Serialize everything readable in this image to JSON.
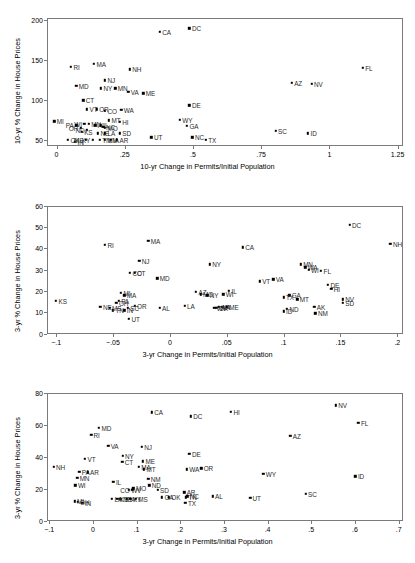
{
  "figure": {
    "panels": [
      "A",
      "B",
      "C"
    ]
  },
  "chart_data": [
    {
      "type": "scatter",
      "title": "Panel A: 1995–2005",
      "xlabel": "10-yr Change in Permits/Initial Population",
      "ylabel": "10-yr % Change in House Prices",
      "xlim": [
        -0.035,
        1.27
      ],
      "ylim": [
        42,
        202
      ],
      "xticks": [
        0,
        0.25,
        0.5,
        0.75,
        1,
        1.25
      ],
      "xticklabels": [
        "0",
        ".25",
        ".5",
        ".75",
        "1",
        "1.25"
      ],
      "yticks": [
        50,
        100,
        150,
        200
      ],
      "yticklabels": [
        "50",
        "100",
        "150",
        "200"
      ],
      "grid": false,
      "legend": false,
      "points": [
        {
          "label": "DC",
          "x": 0.487,
          "y": 189,
          "lp": "r"
        },
        {
          "label": "CA",
          "x": 0.378,
          "y": 185,
          "lp": "r"
        },
        {
          "label": "FL",
          "x": 1.122,
          "y": 140,
          "lp": "r"
        },
        {
          "label": "RI",
          "x": 0.053,
          "y": 141,
          "lp": "r"
        },
        {
          "label": "MA",
          "x": 0.137,
          "y": 145,
          "lp": "r"
        },
        {
          "label": "NH",
          "x": 0.268,
          "y": 138,
          "lp": "r"
        },
        {
          "label": "NJ",
          "x": 0.178,
          "y": 124,
          "lp": "r"
        },
        {
          "label": "AZ",
          "x": 0.862,
          "y": 121,
          "lp": "r"
        },
        {
          "label": "NV",
          "x": 0.935,
          "y": 120,
          "lp": "r"
        },
        {
          "label": "MD",
          "x": 0.072,
          "y": 117,
          "lp": "r"
        },
        {
          "label": "NY",
          "x": 0.163,
          "y": 114,
          "lp": "r"
        },
        {
          "label": "MN",
          "x": 0.215,
          "y": 114,
          "lp": "r"
        },
        {
          "label": "VA",
          "x": 0.263,
          "y": 110,
          "lp": "r"
        },
        {
          "label": "ME",
          "x": 0.318,
          "y": 108,
          "lp": "r"
        },
        {
          "label": "CT",
          "x": 0.098,
          "y": 99,
          "lp": "r"
        },
        {
          "label": "DE",
          "x": 0.487,
          "y": 93,
          "lp": "r"
        },
        {
          "label": "VT",
          "x": 0.112,
          "y": 88,
          "lp": "r"
        },
        {
          "label": "OR",
          "x": 0.147,
          "y": 88,
          "lp": "r"
        },
        {
          "label": "CO",
          "x": 0.178,
          "y": 86,
          "lp": "r"
        },
        {
          "label": "WA",
          "x": 0.237,
          "y": 87,
          "lp": "r"
        },
        {
          "label": "MI",
          "x": -0.008,
          "y": 73,
          "lp": "r"
        },
        {
          "label": "WY",
          "x": 0.452,
          "y": 75,
          "lp": "r"
        },
        {
          "label": "MT",
          "x": 0.192,
          "y": 74,
          "lp": "r"
        },
        {
          "label": "HI",
          "x": 0.232,
          "y": 72,
          "lp": "r"
        },
        {
          "label": "GA",
          "x": 0.478,
          "y": 67,
          "lp": "r"
        },
        {
          "label": "WI",
          "x": 0.102,
          "y": 70,
          "lp": "l"
        },
        {
          "label": "MN2",
          "x": 0.118,
          "y": 70,
          "lp": "r"
        },
        {
          "label": "AL",
          "x": 0.142,
          "y": 68,
          "lp": "r"
        },
        {
          "label": "IL",
          "x": 0.162,
          "y": 68,
          "lp": "r"
        },
        {
          "label": "NC",
          "x": 0.172,
          "y": 66,
          "lp": "r"
        },
        {
          "label": "MO",
          "x": 0.178,
          "y": 65,
          "lp": "r"
        },
        {
          "label": "SC",
          "x": 0.803,
          "y": 61,
          "lp": "r"
        },
        {
          "label": "ID",
          "x": 0.922,
          "y": 58,
          "lp": "r"
        },
        {
          "label": "KS",
          "x": 0.092,
          "y": 60,
          "lp": "r"
        },
        {
          "label": "NE",
          "x": 0.152,
          "y": 58,
          "lp": "r"
        },
        {
          "label": "LA",
          "x": 0.178,
          "y": 58,
          "lp": "r"
        },
        {
          "label": "SD",
          "x": 0.232,
          "y": 58,
          "lp": "r"
        },
        {
          "label": "UT",
          "x": 0.348,
          "y": 53,
          "lp": "r"
        },
        {
          "label": "NC2",
          "x": 0.498,
          "y": 53,
          "lp": "r"
        },
        {
          "label": "TX",
          "x": 0.547,
          "y": 50,
          "lp": "r"
        },
        {
          "label": "OK",
          "x": 0.042,
          "y": 50,
          "lp": "r"
        },
        {
          "label": "IN",
          "x": 0.068,
          "y": 47,
          "lp": "r"
        },
        {
          "label": "MS",
          "x": 0.108,
          "y": 50,
          "lp": "l"
        },
        {
          "label": "KY",
          "x": 0.132,
          "y": 50,
          "lp": "l"
        },
        {
          "label": "TN",
          "x": 0.158,
          "y": 50,
          "lp": "r"
        },
        {
          "label": "NM",
          "x": 0.178,
          "y": 50,
          "lp": "r"
        },
        {
          "label": "IA",
          "x": 0.198,
          "y": 50,
          "lp": "r"
        },
        {
          "label": "AR",
          "x": 0.222,
          "y": 50,
          "lp": "r"
        },
        {
          "label": "ND",
          "x": 0.112,
          "y": 62,
          "lp": "l"
        },
        {
          "label": "OH",
          "x": 0.088,
          "y": 65,
          "lp": "l"
        },
        {
          "label": "PA",
          "x": 0.072,
          "y": 68,
          "lp": "l"
        }
      ]
    },
    {
      "type": "scatter",
      "title": "Panel B: 1999–2002",
      "xlabel": "3-yr Change in Permits/Initial Population",
      "ylabel": "3-yr % Change in House Prices",
      "xlim": [
        -0.108,
        0.205
      ],
      "ylim": [
        0,
        60
      ],
      "xticks": [
        -0.1,
        -0.05,
        0,
        0.05,
        0.1,
        0.15,
        0.2
      ],
      "xticklabels": [
        "−.1",
        "−.05",
        "0",
        ".05",
        ".1",
        ".15",
        ".2"
      ],
      "yticks": [
        0,
        10,
        20,
        30,
        40,
        50,
        60
      ],
      "yticklabels": [
        "0",
        "10",
        "20",
        "30",
        "40",
        "50",
        "60"
      ],
      "grid": false,
      "legend": false,
      "points": [
        {
          "label": "DC",
          "x": 0.158,
          "y": 51,
          "lp": "r"
        },
        {
          "label": "NH",
          "x": 0.194,
          "y": 42,
          "lp": "r"
        },
        {
          "label": "MA",
          "x": -0.019,
          "y": 43.5,
          "lp": "r"
        },
        {
          "label": "RI",
          "x": -0.057,
          "y": 41.5,
          "lp": "r"
        },
        {
          "label": "CA",
          "x": 0.064,
          "y": 40.5,
          "lp": "r"
        },
        {
          "label": "NJ",
          "x": -0.027,
          "y": 34,
          "lp": "r"
        },
        {
          "label": "NY",
          "x": 0.035,
          "y": 32.5,
          "lp": "r"
        },
        {
          "label": "MN",
          "x": 0.115,
          "y": 32.5,
          "lp": "r"
        },
        {
          "label": "WA",
          "x": 0.119,
          "y": 31,
          "lp": "r"
        },
        {
          "label": "WI",
          "x": 0.122,
          "y": 30,
          "lp": "r"
        },
        {
          "label": "FL",
          "x": 0.133,
          "y": 29.5,
          "lp": "r"
        },
        {
          "label": "CO",
          "x": -0.035,
          "y": 28.5,
          "lp": "r"
        },
        {
          "label": "CT",
          "x": -0.031,
          "y": 28.5,
          "lp": "r"
        },
        {
          "label": "MD",
          "x": -0.011,
          "y": 26,
          "lp": "r"
        },
        {
          "label": "VT",
          "x": 0.079,
          "y": 24.5,
          "lp": "r"
        },
        {
          "label": "VA",
          "x": 0.091,
          "y": 25.5,
          "lp": "r"
        },
        {
          "label": "DE",
          "x": 0.139,
          "y": 23,
          "lp": "r"
        },
        {
          "label": "HI",
          "x": 0.142,
          "y": 21,
          "lp": "r"
        },
        {
          "label": "IL",
          "x": 0.052,
          "y": 20,
          "lp": "r"
        },
        {
          "label": "AZ",
          "x": 0.023,
          "y": 19.5,
          "lp": "r"
        },
        {
          "label": "MO",
          "x": 0.027,
          "y": 18.5,
          "lp": "r"
        },
        {
          "label": "NY2",
          "x": 0.033,
          "y": 18,
          "lp": "r"
        },
        {
          "label": "WI2",
          "x": 0.047,
          "y": 18.5,
          "lp": "r"
        },
        {
          "label": "MI",
          "x": -0.043,
          "y": 19,
          "lp": "r"
        },
        {
          "label": "MA2",
          "x": -0.04,
          "y": 18,
          "lp": "r"
        },
        {
          "label": "GA",
          "x": 0.105,
          "y": 18,
          "lp": "r"
        },
        {
          "label": "TX",
          "x": 0.1,
          "y": 17,
          "lp": "r"
        },
        {
          "label": "MT",
          "x": 0.112,
          "y": 16,
          "lp": "r"
        },
        {
          "label": "NV",
          "x": 0.152,
          "y": 16,
          "lp": "r"
        },
        {
          "label": "SD",
          "x": 0.152,
          "y": 14.5,
          "lp": "r"
        },
        {
          "label": "KS",
          "x": -0.1,
          "y": 15.5,
          "lp": "r"
        },
        {
          "label": "AK",
          "x": 0.127,
          "y": 12.5,
          "lp": "r"
        },
        {
          "label": "ND",
          "x": 0.103,
          "y": 11.5,
          "lp": "r"
        },
        {
          "label": "ID",
          "x": 0.1,
          "y": 10.5,
          "lp": "r"
        },
        {
          "label": "NM",
          "x": 0.128,
          "y": 9.5,
          "lp": "r"
        },
        {
          "label": "LA",
          "x": 0.013,
          "y": 13,
          "lp": "r"
        },
        {
          "label": "AL",
          "x": -0.009,
          "y": 12,
          "lp": "r"
        },
        {
          "label": "IA",
          "x": 0.046,
          "y": 12.5,
          "lp": "r"
        },
        {
          "label": "UT",
          "x": -0.036,
          "y": 7,
          "lp": "r"
        },
        {
          "label": "NE",
          "x": -0.061,
          "y": 12.5,
          "lp": "r"
        },
        {
          "label": "OH",
          "x": -0.047,
          "y": 14.5,
          "lp": "r"
        },
        {
          "label": "PA",
          "x": -0.045,
          "y": 15.5,
          "lp": "r"
        },
        {
          "label": "OR",
          "x": -0.031,
          "y": 13,
          "lp": "r"
        },
        {
          "label": "IN",
          "x": -0.04,
          "y": 11,
          "lp": "r"
        },
        {
          "label": "TN",
          "x": -0.05,
          "y": 11,
          "lp": "r"
        },
        {
          "label": "MS",
          "x": -0.053,
          "y": 12,
          "lp": "r"
        },
        {
          "label": "SC",
          "x": -0.037,
          "y": 12,
          "lp": "r"
        },
        {
          "label": "OK",
          "x": 0.041,
          "y": 12,
          "lp": "r"
        },
        {
          "label": "AR",
          "x": 0.043,
          "y": 12.5,
          "lp": "r"
        },
        {
          "label": "WV",
          "x": 0.039,
          "y": 12,
          "lp": "r"
        },
        {
          "label": "ME",
          "x": 0.05,
          "y": 12.5,
          "lp": "r"
        }
      ]
    },
    {
      "type": "scatter",
      "title": "Panel C: 2002–2005",
      "xlabel": "3-yr Change in Permits/Initial Population",
      "ylabel": "3-yr % Change in House Prices",
      "xlim": [
        -0.105,
        0.71
      ],
      "ylim": [
        0,
        80
      ],
      "xticks": [
        -0.1,
        0,
        0.1,
        0.2,
        0.3,
        0.4,
        0.5,
        0.6,
        0.7
      ],
      "xticklabels": [
        "−.1",
        "0",
        ".1",
        ".2",
        ".3",
        ".4",
        ".5",
        ".6",
        ".7"
      ],
      "yticks": [
        0,
        20,
        40,
        60,
        80
      ],
      "yticklabels": [
        "0",
        "20",
        "40",
        "60",
        "80"
      ],
      "grid": false,
      "legend": false,
      "points": [
        {
          "label": "NV",
          "x": 0.556,
          "y": 72.5,
          "lp": "r"
        },
        {
          "label": "HI",
          "x": 0.316,
          "y": 68.5,
          "lp": "r"
        },
        {
          "label": "CA",
          "x": 0.135,
          "y": 68,
          "lp": "r"
        },
        {
          "label": "DC",
          "x": 0.224,
          "y": 65.5,
          "lp": "r"
        },
        {
          "label": "FL",
          "x": 0.608,
          "y": 61.5,
          "lp": "r"
        },
        {
          "label": "MD",
          "x": 0.014,
          "y": 58.5,
          "lp": "r"
        },
        {
          "label": "RI",
          "x": -0.004,
          "y": 54,
          "lp": "r"
        },
        {
          "label": "AZ",
          "x": 0.452,
          "y": 53.5,
          "lp": "r"
        },
        {
          "label": "VA",
          "x": 0.035,
          "y": 47,
          "lp": "r"
        },
        {
          "label": "NJ",
          "x": 0.112,
          "y": 46.5,
          "lp": "r"
        },
        {
          "label": "DE",
          "x": 0.221,
          "y": 42,
          "lp": "r"
        },
        {
          "label": "NY",
          "x": 0.068,
          "y": 41,
          "lp": "r"
        },
        {
          "label": "CT",
          "x": 0.067,
          "y": 37,
          "lp": "r"
        },
        {
          "label": "VT",
          "x": -0.018,
          "y": 39,
          "lp": "r"
        },
        {
          "label": "ME",
          "x": 0.115,
          "y": 37.5,
          "lp": "r"
        },
        {
          "label": "NH",
          "x": -0.09,
          "y": 34,
          "lp": "r"
        },
        {
          "label": "MA",
          "x": 0.105,
          "y": 34,
          "lp": "r"
        },
        {
          "label": "MT",
          "x": 0.117,
          "y": 32.5,
          "lp": "r"
        },
        {
          "label": "WA",
          "x": 0.215,
          "y": 32.5,
          "lp": "r"
        },
        {
          "label": "OR",
          "x": 0.248,
          "y": 33,
          "lp": "r"
        },
        {
          "label": "PA",
          "x": -0.031,
          "y": 31,
          "lp": "r"
        },
        {
          "label": "AR",
          "x": -0.012,
          "y": 30.5,
          "lp": "r"
        },
        {
          "label": "WY",
          "x": 0.39,
          "y": 29.5,
          "lp": "r"
        },
        {
          "label": "ID",
          "x": 0.601,
          "y": 28,
          "lp": "r"
        },
        {
          "label": "MN",
          "x": -0.036,
          "y": 27,
          "lp": "r"
        },
        {
          "label": "NM",
          "x": 0.127,
          "y": 26.5,
          "lp": "r"
        },
        {
          "label": "WI",
          "x": -0.04,
          "y": 22.5,
          "lp": "r"
        },
        {
          "label": "IL",
          "x": 0.047,
          "y": 24.5,
          "lp": "r"
        },
        {
          "label": "ND",
          "x": 0.129,
          "y": 22.5,
          "lp": "r"
        },
        {
          "label": "MO",
          "x": 0.093,
          "y": 20.5,
          "lp": "r"
        },
        {
          "label": "SD",
          "x": 0.148,
          "y": 19.5,
          "lp": "r"
        },
        {
          "label": "WV",
          "x": 0.082,
          "y": 19.5,
          "lp": "r"
        },
        {
          "label": "SC",
          "x": 0.487,
          "y": 17,
          "lp": "r"
        },
        {
          "label": "AL",
          "x": 0.274,
          "y": 15.5,
          "lp": "r"
        },
        {
          "label": "UT",
          "x": 0.36,
          "y": 14.5,
          "lp": "r"
        },
        {
          "label": "AR2",
          "x": 0.209,
          "y": 18,
          "lp": "r"
        },
        {
          "label": "NC",
          "x": 0.216,
          "y": 15.5,
          "lp": "r"
        },
        {
          "label": "TN",
          "x": 0.213,
          "y": 15,
          "lp": "r"
        },
        {
          "label": "TX",
          "x": 0.212,
          "y": 11.5,
          "lp": "r"
        },
        {
          "label": "GA",
          "x": 0.158,
          "y": 15,
          "lp": "r"
        },
        {
          "label": "OK",
          "x": 0.174,
          "y": 15,
          "lp": "r"
        },
        {
          "label": "OH",
          "x": -0.035,
          "y": 12,
          "lp": "r"
        },
        {
          "label": "IN",
          "x": -0.024,
          "y": 11.5,
          "lp": "r"
        },
        {
          "label": "MI",
          "x": -0.042,
          "y": 12.5,
          "lp": "r"
        },
        {
          "label": "KS",
          "x": 0.056,
          "y": 14,
          "lp": "r"
        },
        {
          "label": "NE",
          "x": 0.063,
          "y": 14,
          "lp": "r"
        },
        {
          "label": "IA",
          "x": 0.078,
          "y": 14,
          "lp": "r"
        },
        {
          "label": "KY",
          "x": 0.086,
          "y": 14,
          "lp": "r"
        },
        {
          "label": "MS",
          "x": 0.098,
          "y": 14,
          "lp": "r"
        },
        {
          "label": "LA",
          "x": 0.044,
          "y": 14,
          "lp": "r"
        },
        {
          "label": "CO",
          "x": 0.09,
          "y": 19.5,
          "lp": "l"
        }
      ]
    }
  ]
}
